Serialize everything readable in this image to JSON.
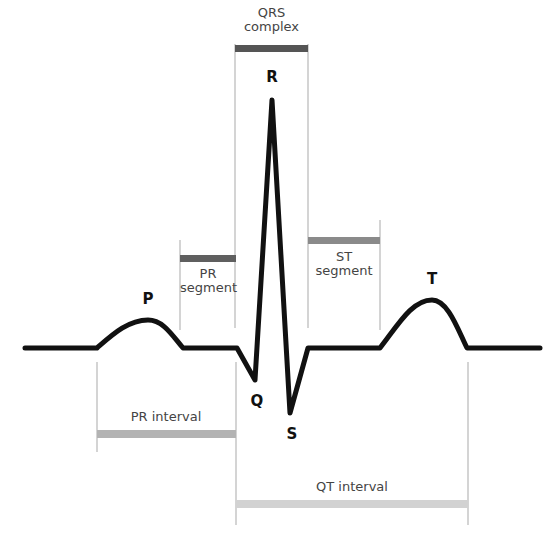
{
  "diagram": {
    "waves": [
      {
        "key": "P",
        "label": "P"
      },
      {
        "key": "Q",
        "label": "Q"
      },
      {
        "key": "R",
        "label": "R"
      },
      {
        "key": "S",
        "label": "S"
      },
      {
        "key": "T",
        "label": "T"
      }
    ],
    "segments": {
      "qrs_complex": {
        "line1": "QRS",
        "line2": "complex",
        "color": "#555555"
      },
      "pr_segment": {
        "line1": "PR",
        "line2": "segment",
        "color": "#5f5f5f"
      },
      "st_segment": {
        "line1": "ST",
        "line2": "segment",
        "color": "#8a8a8a"
      }
    },
    "intervals": {
      "pr_interval": {
        "label": "PR interval",
        "color": "#b3b3b3"
      },
      "qt_interval": {
        "label": "QT interval",
        "color": "#d2d2d2"
      }
    },
    "colors": {
      "trace": "#111111",
      "marker_lines": "#b8b8b8",
      "text": "#444444",
      "background": "#ffffff"
    }
  }
}
